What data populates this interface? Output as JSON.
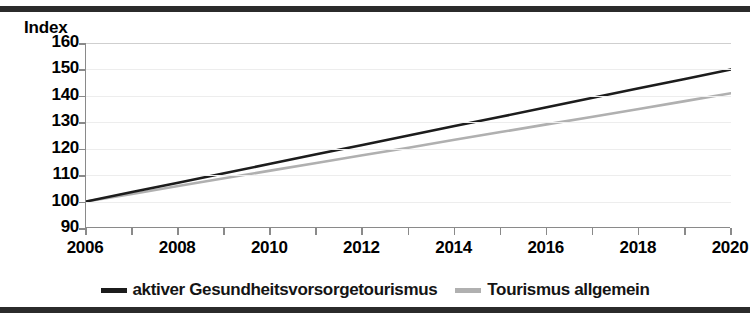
{
  "figure": {
    "axis_title": "Index",
    "border_color": "#2b2b2b"
  },
  "chart_data": {
    "type": "line",
    "title": "",
    "subtitle": "",
    "xlabel": "",
    "ylabel": "Index",
    "grid": true,
    "legend_position": "bottom",
    "xlim": [
      2006,
      2020
    ],
    "ylim": [
      90,
      160
    ],
    "yticks": [
      160,
      150,
      140,
      130,
      120,
      110,
      100,
      90
    ],
    "xticks": [
      2006,
      2007,
      2008,
      2009,
      2010,
      2011,
      2012,
      2013,
      2014,
      2015,
      2016,
      2017,
      2018,
      2019,
      2020
    ],
    "xtick_labels": [
      "2006",
      "2008",
      "2010",
      "2012",
      "2014",
      "2016",
      "2018",
      "2020"
    ],
    "xtick_label_values": [
      2006,
      2008,
      2010,
      2012,
      2014,
      2016,
      2018,
      2020
    ],
    "x": [
      2006,
      2007,
      2008,
      2009,
      2010,
      2011,
      2012,
      2013,
      2014,
      2015,
      2016,
      2017,
      2018,
      2019,
      2020
    ],
    "series": [
      {
        "name": "aktiver Gesundheitsvorsorgetourismus",
        "color": "#1c1c1c",
        "width": 2.6,
        "values": [
          100.0,
          103.6,
          107.1,
          110.7,
          114.3,
          117.9,
          121.4,
          125.0,
          128.6,
          132.1,
          135.7,
          139.3,
          142.9,
          146.4,
          150.0
        ]
      },
      {
        "name": "Tourismus allgemein",
        "color": "#b0b0b0",
        "width": 2.6,
        "values": [
          100.0,
          102.9,
          105.9,
          108.8,
          111.7,
          114.6,
          117.5,
          120.4,
          123.4,
          126.3,
          129.2,
          132.1,
          135.0,
          138.0,
          141.0
        ]
      }
    ]
  },
  "legend": {
    "items": [
      {
        "label": "aktiver Gesundheitsvorsorgetourismus",
        "color": "#1c1c1c"
      },
      {
        "label": "Tourismus allgemein",
        "color": "#b0b0b0"
      }
    ]
  }
}
